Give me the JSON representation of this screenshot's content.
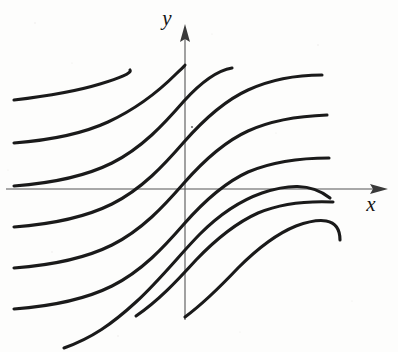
{
  "figure": {
    "background_color": "#fdfdfc",
    "curve_color": "#1a1a1a",
    "axis_color": "#555555",
    "width": 398,
    "height": 352
  },
  "axes": {
    "x_axis": {
      "label": "x",
      "label_x": 371,
      "label_y": 211,
      "origin_x": 185,
      "origin_y": 189,
      "start_x": 6,
      "end_x": 380,
      "arrow_direction": "right"
    },
    "y_axis": {
      "label": "y",
      "label_x": 167,
      "label_y": 25,
      "origin_x": 185,
      "origin_y": 189,
      "start_y": 320,
      "end_y": 28,
      "arrow_direction": "up"
    }
  },
  "chart_data": {
    "type": "line",
    "xlabel": "x",
    "ylabel": "y",
    "grid": false,
    "legend": "none",
    "curve_count": 9,
    "horizontal_shift_px": 49,
    "vertical_shift_px": 42,
    "curves": [
      {
        "name": "curve-1",
        "path": "M 14 100 C 48 96 74 92 100 84 C 120 78 132 73 130 70"
      },
      {
        "name": "curve-2",
        "path": "M 14 143 C 52 140 82 134 108 122 C 136 109 160 90 176 74 C 182 68 185 66 185 65"
      },
      {
        "name": "curve-3",
        "path": "M 14 186 C 54 183 86 176 112 163 C 142 148 164 124 184 101 C 204 79 220 70 232 68"
      },
      {
        "name": "curve-4",
        "path": "M 14 227 C 54 224 86 217 112 204 C 142 189 164 165 184 142 C 206 117 226 100 248 90 C 272 79 296 75 322 75"
      },
      {
        "name": "curve-5",
        "path": "M 14 268 C 54 265 86 258 112 245 C 142 230 164 206 184 183 C 206 158 226 141 248 131 C 272 120 300 116 327 115"
      },
      {
        "name": "curve-6",
        "path": "M 14 309 C 54 306 86 299 112 286 C 142 271 164 247 184 224 C 206 199 226 182 248 172 C 274 161 304 158 329 158"
      },
      {
        "name": "curve-7",
        "path": "M 64 348 C 92 338 112 324 136 302 C 160 280 182 252 200 234 C 222 212 242 200 262 193 C 286 185 310 182 330 198"
      },
      {
        "name": "curve-8",
        "path": "M 136 316 C 158 301 176 282 196 260 C 218 237 238 222 258 213 C 282 203 310 201 333 202"
      },
      {
        "name": "curve-9",
        "path": "M 185 317 C 204 303 220 287 238 268 C 258 248 276 234 296 226 C 318 218 340 216 340 240"
      }
    ],
    "endpoints_left": [
      100,
      143,
      186,
      227,
      268,
      309
    ],
    "endpoints_right": [
      75,
      115,
      158,
      198,
      239,
      283
    ],
    "endpoints_top": [
      70,
      65,
      68
    ],
    "endpoints_bottom": [
      316,
      317
    ]
  },
  "artifacts": {
    "speckle_note": "scan noise dot",
    "speckle_x": 192,
    "speckle_y": 127
  }
}
